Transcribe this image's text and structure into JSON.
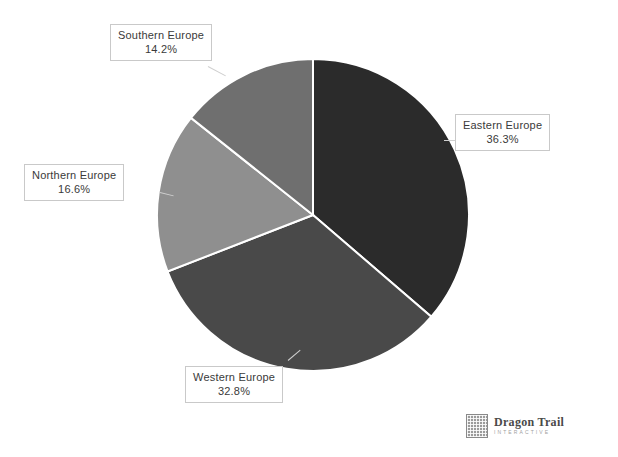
{
  "chart_data": {
    "type": "pie",
    "title": "",
    "subtitle": "",
    "xlabel": "",
    "ylabel": "",
    "legend_position": "none",
    "grid": false,
    "labels_outside": true,
    "start_angle_deg": 0,
    "direction": "clockwise",
    "categories": [
      "Eastern Europe",
      "Western Europe",
      "Northern Europe",
      "Southern Europe"
    ],
    "values": [
      36.3,
      32.8,
      16.6,
      14.2
    ],
    "value_suffix": "%",
    "slices": [
      {
        "label": "Eastern Europe",
        "value": 36.3,
        "value_text": "36.3%",
        "color": "#2b2b2b",
        "start_deg": 0.0,
        "end_deg": 130.68
      },
      {
        "label": "Western Europe",
        "value": 32.8,
        "value_text": "32.8%",
        "color": "#494949",
        "start_deg": 130.68,
        "end_deg": 248.76
      },
      {
        "label": "Northern Europe",
        "value": 16.6,
        "value_text": "16.6%",
        "color": "#8f8f8f",
        "start_deg": 248.76,
        "end_deg": 308.52
      },
      {
        "label": "Southern Europe",
        "value": 14.2,
        "value_text": "14.2%",
        "color": "#6f6f6f",
        "start_deg": 308.52,
        "end_deg": 360.0
      }
    ],
    "separator_color": "#ffffff",
    "background_color": "#ffffff"
  },
  "callouts": {
    "southern": {
      "name": "Southern Europe",
      "value": "14.2%"
    },
    "eastern": {
      "name": "Eastern Europe",
      "value": "36.3%"
    },
    "northern": {
      "name": "Northern Europe",
      "value": "16.6%"
    },
    "western": {
      "name": "Western Europe",
      "value": "32.8%"
    }
  },
  "brand": {
    "name": "Dragon Trail",
    "tagline": "INTERACTIVE"
  }
}
